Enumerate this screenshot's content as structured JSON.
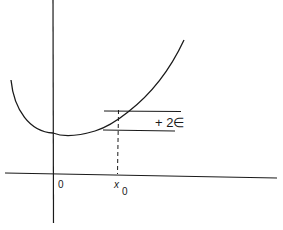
{
  "diagram": {
    "type": "function-graph",
    "colors": {
      "stroke": "#1a1a1a",
      "background": "#ffffff"
    },
    "labels": {
      "origin": "0",
      "x0_main": "x",
      "x0_sub": "0",
      "band": "+ 2∈"
    },
    "elements": [
      "x-axis",
      "y-axis",
      "curve",
      "upper-band-line",
      "lower-band-line",
      "dashed-x0-line"
    ]
  }
}
